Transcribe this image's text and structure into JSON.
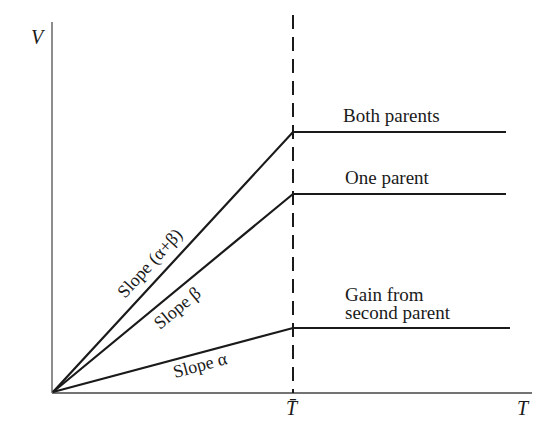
{
  "diagram": {
    "axes": {
      "y_label": "V",
      "x_label": "T",
      "x_marker_label": "T̄"
    },
    "curves": [
      {
        "name": "Both parents",
        "slope_label": "Slope (α+β)",
        "plateau_y": 132
      },
      {
        "name": "One parent",
        "slope_label": "Slope β",
        "plateau_y": 194
      },
      {
        "name": "Gain from second parent",
        "label_line1": "Gain from",
        "label_line2": "second parent",
        "slope_label": "Slope α",
        "plateau_y": 328
      }
    ],
    "colors": {
      "line": "#1a1a1a",
      "axis": "#555555",
      "background": "#ffffff"
    }
  }
}
